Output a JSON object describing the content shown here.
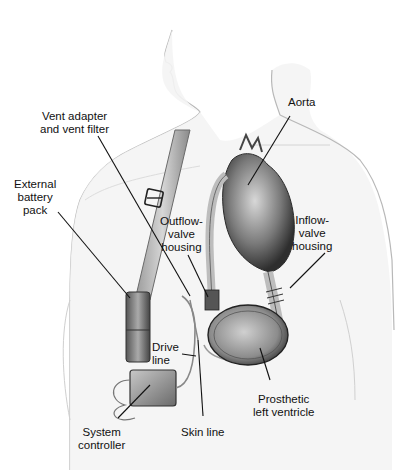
{
  "diagram": {
    "labels": {
      "vent_adapter": [
        "Vent adapter",
        "and vent filter"
      ],
      "aorta": [
        "Aorta"
      ],
      "external_battery": [
        "External",
        "battery",
        "pack"
      ],
      "outflow_valve": [
        "Outflow-",
        "valve",
        "housing"
      ],
      "inflow_valve": [
        "Inflow-",
        "valve",
        "housing"
      ],
      "drive_line": [
        "Drive",
        "line"
      ],
      "prosthetic_lv": [
        "Prosthetic",
        "left ventricle"
      ],
      "system_controller": [
        "System",
        "controller"
      ],
      "skin_line": [
        "Skin line"
      ]
    },
    "colors": {
      "skin_outline": "#b8b8b8",
      "skin_shade": "#ececec",
      "device_gray": "#8a8a8a",
      "dark": "#3a3a3a",
      "leader": "#111111"
    }
  }
}
